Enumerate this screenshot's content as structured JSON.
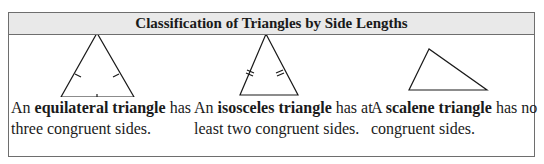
{
  "title": "Classification of Triangles by Side Lengths",
  "columns": [
    {
      "figure": "equilateral-triangle",
      "pre": "An ",
      "term": "equilateral triangle",
      "post": " has",
      "line2": "three congruent sides."
    },
    {
      "figure": "isosceles-triangle",
      "pre": "An ",
      "term": "isosceles triangle",
      "post": " has at",
      "line2": "least two congruent sides."
    },
    {
      "figure": "scalene-triangle",
      "pre": "A ",
      "term": "scalene triangle",
      "post": " has no",
      "line2": "congruent sides."
    }
  ]
}
